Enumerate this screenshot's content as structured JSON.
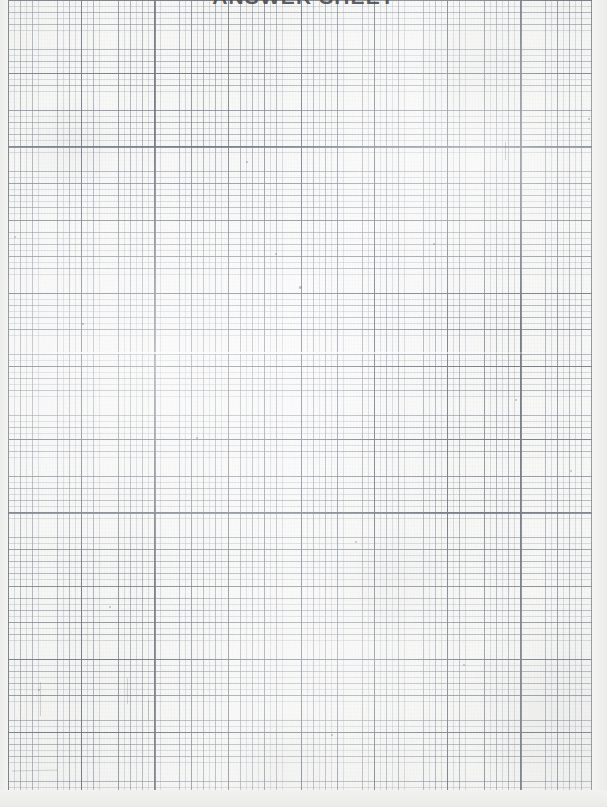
{
  "document": {
    "kind": "scanned-graph-paper",
    "title": "ANSWER SHEET",
    "title_visibility": "clipped-at-top-edge",
    "page_width_px": 607,
    "page_height_px": 807,
    "body_text": "",
    "handwriting": "none"
  },
  "grid": {
    "label": "engineering graph paper grid",
    "minor_spacing_px": 6.1,
    "medium_spacing_px": 12.2,
    "sub_heavy_spacing_px": 36.6,
    "heavy_spacing_px": 73.2,
    "minor_color": "#76808e",
    "medium_color": "#697484",
    "heavy_color": "#58606e",
    "paper_color": "#f4f4f2",
    "columns_heavy": 8,
    "rows_heavy": 11,
    "left_margin_px": 8,
    "right_margin_px": 15,
    "bottom_margin_px": 17
  },
  "artifacts": {
    "scan_streak_label": "horizontal scan streak",
    "specks": [
      {
        "x": 14,
        "y": 236,
        "size": 2.4
      },
      {
        "x": 275,
        "y": 253,
        "size": 1.8
      },
      {
        "x": 299,
        "y": 286,
        "size": 2.6
      },
      {
        "x": 433,
        "y": 243,
        "size": 1.6
      },
      {
        "x": 82,
        "y": 323,
        "size": 1.7
      },
      {
        "x": 196,
        "y": 437,
        "size": 1.9
      },
      {
        "x": 515,
        "y": 399,
        "size": 1.5
      },
      {
        "x": 355,
        "y": 541,
        "size": 2.1
      },
      {
        "x": 109,
        "y": 606,
        "size": 1.6
      },
      {
        "x": 463,
        "y": 664,
        "size": 1.8
      },
      {
        "x": 331,
        "y": 734,
        "size": 2.0
      },
      {
        "x": 588,
        "y": 118,
        "size": 1.7
      },
      {
        "x": 38,
        "y": 689,
        "size": 1.6
      },
      {
        "x": 246,
        "y": 161,
        "size": 1.5
      },
      {
        "x": 570,
        "y": 470,
        "size": 1.9
      }
    ],
    "streaklets": [
      {
        "x": 40,
        "y": 682,
        "w": 1.2,
        "h": 34,
        "rot": 0
      },
      {
        "x": 127,
        "y": 678,
        "w": 1.1,
        "h": 26,
        "rot": 0
      },
      {
        "x": 12,
        "y": 770,
        "w": 46,
        "h": 1.2,
        "rot": -1
      },
      {
        "x": 148,
        "y": 700,
        "w": 1.1,
        "h": 20,
        "rot": 0
      },
      {
        "x": 505,
        "y": 142,
        "w": 1.1,
        "h": 18,
        "rot": 0
      }
    ]
  }
}
